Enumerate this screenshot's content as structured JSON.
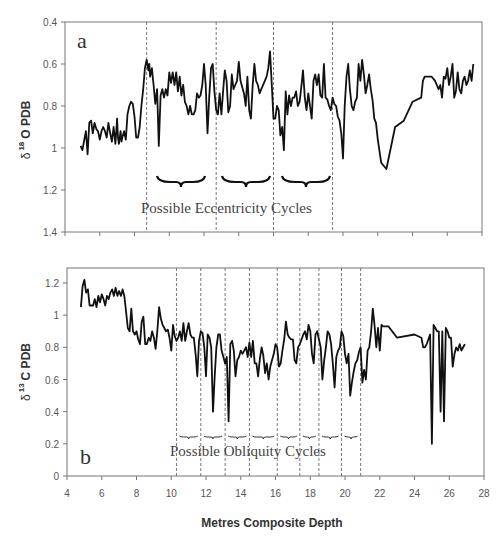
{
  "chart_data": [
    {
      "id": "a",
      "type": "line",
      "panel_label": "a",
      "ylabel": "δ 18 O PDB",
      "ylabel_main": "δ",
      "ylabel_sup": "18",
      "ylabel_rest": "O PDB",
      "xlabel": "Metres Composite Depth",
      "ylim": [
        1.4,
        0.4
      ],
      "y_inverted": true,
      "xlim": [
        4,
        28
      ],
      "yticks": [
        "0.4",
        "0.6",
        "0.8",
        "1",
        "1.2",
        "1.4"
      ],
      "ytick_values": [
        0.4,
        0.6,
        0.8,
        1.0,
        1.2,
        1.4
      ],
      "xtick_values": [
        4,
        6,
        8,
        10,
        12,
        14,
        16,
        18,
        20,
        22,
        24,
        26,
        28
      ],
      "xticks_labeled": false,
      "grid": false,
      "annotation": "Possible Eccentricity Cycles",
      "cycle_boundaries_m": [
        8.7,
        12.7,
        16.0,
        19.4
      ],
      "series": [
        {
          "name": "δ18O",
          "x": [
            4.9,
            5.0,
            5.2,
            5.3,
            5.4,
            5.5,
            5.6,
            5.7,
            5.8,
            5.9,
            6.0,
            6.1,
            6.2,
            6.3,
            6.4,
            6.5,
            6.6,
            6.7,
            6.8,
            6.9,
            7.0,
            7.05,
            7.1,
            7.2,
            7.25,
            7.3,
            7.4,
            7.5,
            7.6,
            7.7,
            7.8,
            7.9,
            8.0,
            8.1,
            8.2,
            8.3,
            8.4,
            8.5,
            8.6,
            8.7,
            8.8,
            8.85,
            8.9,
            9.0,
            9.05,
            9.1,
            9.2,
            9.3,
            9.4,
            9.5,
            9.6,
            9.7,
            9.8,
            9.9,
            10.0,
            10.1,
            10.2,
            10.3,
            10.4,
            10.5,
            10.6,
            10.7,
            10.8,
            10.9,
            11.0,
            11.1,
            11.2,
            11.3,
            11.4,
            11.5,
            11.6,
            11.7,
            11.8,
            11.9,
            12.0,
            12.1,
            12.2,
            12.3,
            12.4,
            12.5,
            12.6,
            12.7,
            12.8,
            12.9,
            13.0,
            13.1,
            13.2,
            13.3,
            13.4,
            13.5,
            13.6,
            13.7,
            13.8,
            13.9,
            14.0,
            14.1,
            14.2,
            14.3,
            14.4,
            14.5,
            14.6,
            14.7,
            14.8,
            14.9,
            15.0,
            15.1,
            15.2,
            15.3,
            15.4,
            15.5,
            15.6,
            15.7,
            15.8,
            15.9,
            16.0,
            16.1,
            16.2,
            16.3,
            16.4,
            16.5,
            16.6,
            16.7,
            16.8,
            16.9,
            17.0,
            17.1,
            17.2,
            17.3,
            17.4,
            17.5,
            17.6,
            17.7,
            17.8,
            17.9,
            18.0,
            18.1,
            18.2,
            18.3,
            18.4,
            18.5,
            18.6,
            18.7,
            18.8,
            18.9,
            19.0,
            19.1,
            19.2,
            19.3,
            19.4,
            19.5,
            19.6,
            19.7,
            19.8,
            19.9,
            20.0,
            20.1,
            20.2,
            20.3,
            20.4,
            20.5,
            20.6,
            20.7,
            20.8,
            20.9,
            21.0,
            21.1,
            21.2,
            21.3,
            21.4,
            21.5,
            21.6,
            21.7,
            21.8,
            21.9,
            22.0,
            22.2,
            22.5,
            23.0,
            23.5,
            24.0,
            24.5,
            24.6,
            24.7,
            24.8,
            24.9,
            25.0,
            25.1,
            25.2,
            25.3,
            25.4,
            25.5,
            25.6,
            25.7,
            25.8,
            25.9,
            26.0,
            26.1,
            26.2,
            26.3,
            26.4,
            26.5,
            26.6,
            26.7,
            26.8,
            26.9,
            27.0,
            27.1,
            27.2,
            27.3,
            27.4,
            27.5
          ],
          "y": [
            0.99,
            1.01,
            0.92,
            1.03,
            0.88,
            0.87,
            0.93,
            0.88,
            0.91,
            0.92,
            0.96,
            0.92,
            0.9,
            0.92,
            0.95,
            0.88,
            0.93,
            0.97,
            0.9,
            0.98,
            0.86,
            0.95,
            0.98,
            0.92,
            0.97,
            0.95,
            0.92,
            0.96,
            0.84,
            0.8,
            0.78,
            0.79,
            0.85,
            0.95,
            0.95,
            0.9,
            0.8,
            0.72,
            0.62,
            0.58,
            0.63,
            0.6,
            0.66,
            0.62,
            0.66,
            0.7,
            0.79,
            0.72,
            0.99,
            0.75,
            0.72,
            0.76,
            0.72,
            0.75,
            0.64,
            0.69,
            0.64,
            0.7,
            0.64,
            0.73,
            0.66,
            0.75,
            0.7,
            0.78,
            0.8,
            0.84,
            0.8,
            0.84,
            0.84,
            0.82,
            0.74,
            0.76,
            0.75,
            0.7,
            0.6,
            0.7,
            0.93,
            0.76,
            0.62,
            0.6,
            0.73,
            0.82,
            0.84,
            0.74,
            0.84,
            0.73,
            0.63,
            0.68,
            0.83,
            0.8,
            0.65,
            0.72,
            0.7,
            0.68,
            0.59,
            0.68,
            0.71,
            0.74,
            0.8,
            0.66,
            0.82,
            0.86,
            0.7,
            0.6,
            0.68,
            0.7,
            0.74,
            0.72,
            0.7,
            0.68,
            0.66,
            0.62,
            0.54,
            0.7,
            0.86,
            0.86,
            0.8,
            0.82,
            0.94,
            0.9,
            1.01,
            0.73,
            0.84,
            0.75,
            0.8,
            0.76,
            0.76,
            0.73,
            0.8,
            0.78,
            0.71,
            0.63,
            0.76,
            0.82,
            0.74,
            0.8,
            0.86,
            0.68,
            0.65,
            0.7,
            0.65,
            0.75,
            0.76,
            0.6,
            0.76,
            0.77,
            0.8,
            0.82,
            0.76,
            0.79,
            0.8,
            0.85,
            0.87,
            0.93,
            1.05,
            0.8,
            0.66,
            0.6,
            0.72,
            0.8,
            0.82,
            0.78,
            0.76,
            0.6,
            0.68,
            0.58,
            0.65,
            0.74,
            0.7,
            0.65,
            0.72,
            0.77,
            0.86,
            0.88,
            0.96,
            1.07,
            1.1,
            0.9,
            0.87,
            0.78,
            0.76,
            0.68,
            0.66,
            0.66,
            0.66,
            0.66,
            0.66,
            0.67,
            0.68,
            0.7,
            0.72,
            0.7,
            0.76,
            0.66,
            0.67,
            0.62,
            0.7,
            0.66,
            0.6,
            0.76,
            0.73,
            0.64,
            0.72,
            0.74,
            0.68,
            0.66,
            0.7,
            0.68,
            0.63,
            0.68,
            0.6,
            0.61,
            0.62,
            0.72,
            0.76,
            0.7,
            0.66,
            0.7,
            0.73,
            0.65,
            0.64,
            0.6,
            0.52,
            0.68,
            0.73,
            0.65,
            0.7,
            0.73,
            0.66,
            0.61,
            0.62
          ]
        }
      ]
    },
    {
      "id": "b",
      "type": "line",
      "panel_label": "b",
      "ylabel": "δ 13 C PDB",
      "ylabel_main": "δ",
      "ylabel_sup": "13",
      "ylabel_rest": "C PDB",
      "xlabel": "Metres Composite Depth",
      "ylim": [
        0,
        1.2
      ],
      "xlim": [
        4,
        28
      ],
      "yticks": [
        "0",
        "0.2",
        "0.4",
        "0.6",
        "0.8",
        "1",
        "1.2"
      ],
      "ytick_values": [
        0,
        0.2,
        0.4,
        0.6,
        0.8,
        1.0,
        1.2
      ],
      "xticks": [
        "4",
        "6",
        "8",
        "10",
        "12",
        "14",
        "16",
        "18",
        "20",
        "22",
        "24",
        "26",
        "28"
      ],
      "xtick_values": [
        4,
        6,
        8,
        10,
        12,
        14,
        16,
        18,
        20,
        22,
        24,
        26,
        28
      ],
      "grid": false,
      "annotation": "Possible Obliquity Cycles",
      "cycle_boundaries_m": [
        10.3,
        11.7,
        13.1,
        14.5,
        16.1,
        17.4,
        18.5,
        19.8,
        20.9
      ],
      "series": [
        {
          "name": "δ13C",
          "x": [
            4.8,
            4.9,
            5.0,
            5.1,
            5.2,
            5.3,
            5.4,
            5.5,
            5.6,
            5.7,
            5.8,
            5.9,
            6.0,
            6.1,
            6.2,
            6.3,
            6.4,
            6.5,
            6.6,
            6.7,
            6.8,
            6.9,
            7.0,
            7.1,
            7.2,
            7.3,
            7.4,
            7.5,
            7.6,
            7.7,
            7.8,
            7.9,
            8.0,
            8.1,
            8.2,
            8.3,
            8.4,
            8.5,
            8.6,
            8.7,
            8.8,
            8.9,
            9.0,
            9.1,
            9.2,
            9.3,
            9.4,
            9.5,
            9.6,
            9.7,
            9.8,
            9.9,
            10.0,
            10.1,
            10.2,
            10.3,
            10.4,
            10.5,
            10.6,
            10.7,
            10.8,
            10.9,
            11.0,
            11.1,
            11.2,
            11.3,
            11.4,
            11.5,
            11.6,
            11.7,
            11.8,
            11.9,
            12.0,
            12.1,
            12.2,
            12.3,
            12.4,
            12.5,
            12.6,
            12.7,
            12.8,
            12.9,
            13.0,
            13.1,
            13.2,
            13.3,
            13.4,
            13.5,
            13.6,
            13.7,
            13.8,
            13.9,
            14.0,
            14.1,
            14.2,
            14.3,
            14.4,
            14.5,
            14.6,
            14.7,
            14.8,
            14.9,
            15.0,
            15.1,
            15.2,
            15.3,
            15.4,
            15.5,
            15.6,
            15.7,
            15.8,
            15.9,
            16.0,
            16.1,
            16.2,
            16.3,
            16.4,
            16.5,
            16.6,
            16.7,
            16.8,
            16.9,
            17.0,
            17.1,
            17.2,
            17.3,
            17.4,
            17.5,
            17.6,
            17.7,
            17.8,
            17.9,
            18.0,
            18.1,
            18.2,
            18.3,
            18.4,
            18.5,
            18.6,
            18.7,
            18.8,
            18.9,
            19.0,
            19.1,
            19.2,
            19.3,
            19.4,
            19.5,
            19.6,
            19.7,
            19.8,
            19.9,
            20.0,
            20.1,
            20.2,
            20.3,
            20.4,
            20.5,
            20.6,
            20.7,
            20.8,
            20.9,
            21.0,
            21.1,
            21.2,
            21.3,
            21.4,
            21.5,
            21.6,
            21.7,
            21.8,
            21.9,
            22.0,
            22.1,
            22.2,
            22.3,
            22.4,
            22.5,
            23.0,
            24.0,
            24.4,
            24.5,
            24.6,
            24.7,
            24.8,
            24.9,
            25.0,
            25.1,
            25.2,
            25.3,
            25.4,
            25.5,
            25.6,
            25.7,
            25.8,
            25.9,
            26.0,
            26.1,
            26.2,
            26.3,
            26.4,
            26.5,
            26.6,
            26.7,
            26.8,
            26.9,
            27.0,
            27.1,
            27.2,
            27.3,
            27.4,
            27.5,
            27.6
          ],
          "y": [
            1.05,
            1.18,
            1.22,
            1.14,
            1.16,
            1.06,
            1.06,
            1.06,
            1.1,
            1.05,
            1.12,
            1.08,
            1.13,
            1.1,
            1.06,
            1.12,
            1.1,
            1.14,
            1.16,
            1.12,
            1.17,
            1.12,
            1.15,
            1.12,
            1.16,
            1.12,
            1.02,
            0.92,
            0.9,
            1.04,
            0.9,
            0.88,
            0.9,
            0.85,
            0.82,
            0.96,
            0.99,
            0.82,
            0.82,
            0.86,
            0.84,
            0.9,
            0.86,
            0.79,
            0.9,
            1.05,
            0.98,
            0.94,
            0.92,
            0.9,
            0.91,
            0.86,
            0.78,
            0.94,
            0.87,
            0.84,
            0.86,
            0.9,
            0.84,
            0.95,
            0.84,
            0.9,
            0.95,
            0.88,
            0.86,
            0.86,
            0.76,
            0.62,
            0.84,
            0.9,
            0.89,
            0.8,
            0.62,
            0.88,
            0.86,
            0.8,
            0.4,
            0.62,
            0.8,
            0.88,
            0.88,
            0.78,
            0.74,
            0.7,
            0.74,
            0.34,
            0.82,
            0.84,
            0.78,
            0.62,
            0.72,
            0.74,
            0.78,
            0.76,
            0.78,
            0.8,
            0.74,
            0.83,
            0.74,
            0.84,
            0.7,
            0.7,
            0.62,
            0.73,
            0.8,
            0.75,
            0.64,
            0.7,
            0.6,
            0.68,
            0.72,
            0.76,
            0.82,
            0.8,
            0.68,
            0.7,
            0.78,
            0.85,
            0.96,
            0.88,
            0.86,
            0.85,
            0.85,
            0.72,
            0.7,
            0.8,
            0.82,
            0.85,
            0.88,
            0.9,
            0.85,
            0.94,
            0.9,
            0.76,
            0.7,
            0.88,
            0.9,
            0.85,
            0.8,
            0.6,
            0.72,
            0.8,
            0.9,
            0.88,
            0.82,
            0.7,
            0.55,
            0.74,
            0.78,
            0.8,
            0.9,
            0.87,
            0.76,
            0.7,
            0.76,
            0.5,
            0.58,
            0.65,
            0.7,
            0.72,
            0.77,
            0.8,
            0.58,
            0.66,
            0.6,
            0.78,
            0.8,
            0.9,
            1.04,
            0.94,
            0.8,
            0.92,
            0.78,
            0.94,
            0.93,
            0.93,
            0.93,
            0.93,
            0.86,
            0.88,
            0.86,
            0.8,
            0.8,
            0.82,
            0.85,
            0.88,
            0.2,
            0.94,
            0.92,
            0.9,
            0.9,
            0.4,
            0.9,
            0.34,
            0.92,
            0.9,
            0.86,
            0.86,
            0.68,
            0.76,
            0.8,
            0.78,
            0.82,
            0.78,
            0.8,
            0.82
          ]
        }
      ]
    }
  ]
}
